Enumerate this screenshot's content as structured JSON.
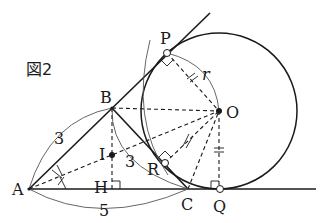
{
  "figure": {
    "title": "図2",
    "points": {
      "A": {
        "label": "A"
      },
      "B": {
        "label": "B"
      },
      "C": {
        "label": "C"
      },
      "H": {
        "label": "H"
      },
      "I": {
        "label": "I"
      },
      "O": {
        "label": "O"
      },
      "P": {
        "label": "P"
      },
      "Q": {
        "label": "Q"
      },
      "R": {
        "label": "R"
      }
    },
    "lengths": {
      "AB": "3",
      "BC": "3",
      "AC": "5",
      "radius": "r"
    }
  }
}
